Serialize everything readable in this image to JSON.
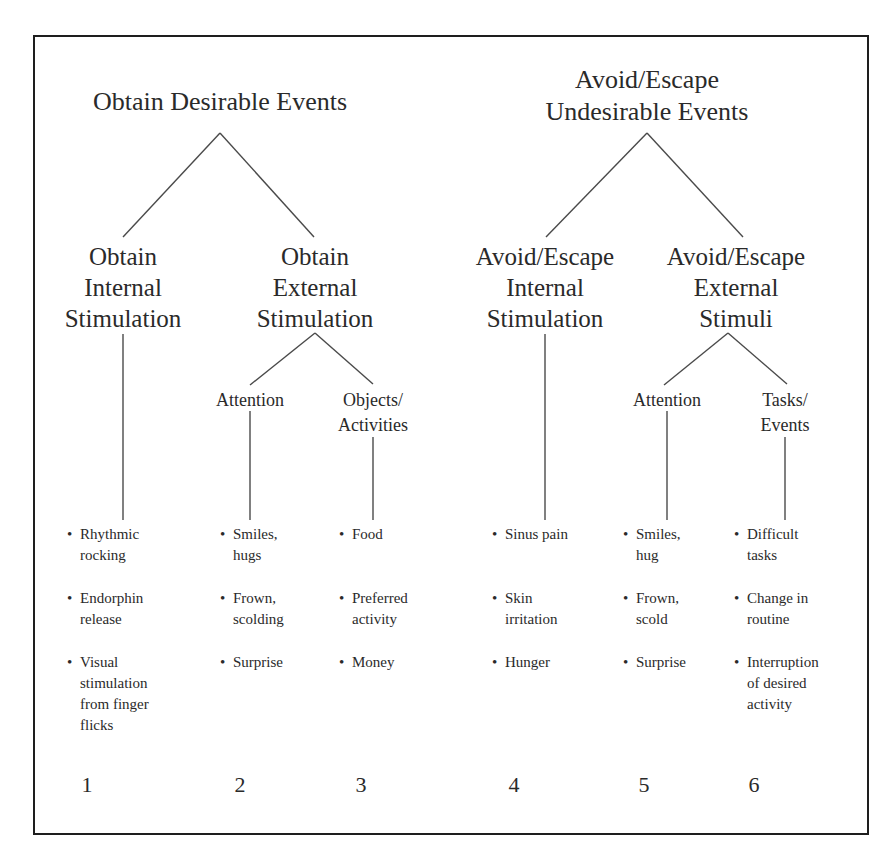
{
  "diagram": {
    "type": "tree",
    "roots": [
      {
        "label": "Obtain Desirable Events",
        "children": [
          {
            "label": "Obtain\nInternal\nStimulation",
            "column": "1",
            "examples": [
              "Rhythmic\nrocking",
              "Endorphin\nrelease",
              "Visual\nstimulation\nfrom finger\nflicks"
            ]
          },
          {
            "label": "Obtain\nExternal\nStimulation",
            "children": [
              {
                "label": "Attention",
                "column": "2",
                "examples": [
                  "Smiles,\nhugs",
                  "Frown,\nscolding",
                  "Surprise"
                ]
              },
              {
                "label": "Objects/\nActivities",
                "column": "3",
                "examples": [
                  "Food",
                  "Preferred\nactivity",
                  "Money"
                ]
              }
            ]
          }
        ]
      },
      {
        "label": "Avoid/Escape\nUndesirable Events",
        "children": [
          {
            "label": "Avoid/Escape\nInternal\nStimulation",
            "column": "4",
            "examples": [
              "Sinus pain",
              "Skin\nirritation",
              "Hunger"
            ]
          },
          {
            "label": "Avoid/Escape\nExternal\nStimuli",
            "children": [
              {
                "label": "Attention",
                "column": "5",
                "examples": [
                  "Smiles,\nhug",
                  "Frown,\nscold",
                  "Surprise"
                ]
              },
              {
                "label": "Tasks/\nEvents",
                "column": "6",
                "examples": [
                  "Difficult\ntasks",
                  "Change in\nroutine",
                  "Interruption\nof desired\nactivity"
                ]
              }
            ]
          }
        ]
      }
    ]
  },
  "bullet_glyph": "•",
  "colors": {
    "text": "#2a2a2a",
    "lines": "#4a4a4a",
    "frame": "#1e1e1e",
    "background": "#ffffff"
  }
}
